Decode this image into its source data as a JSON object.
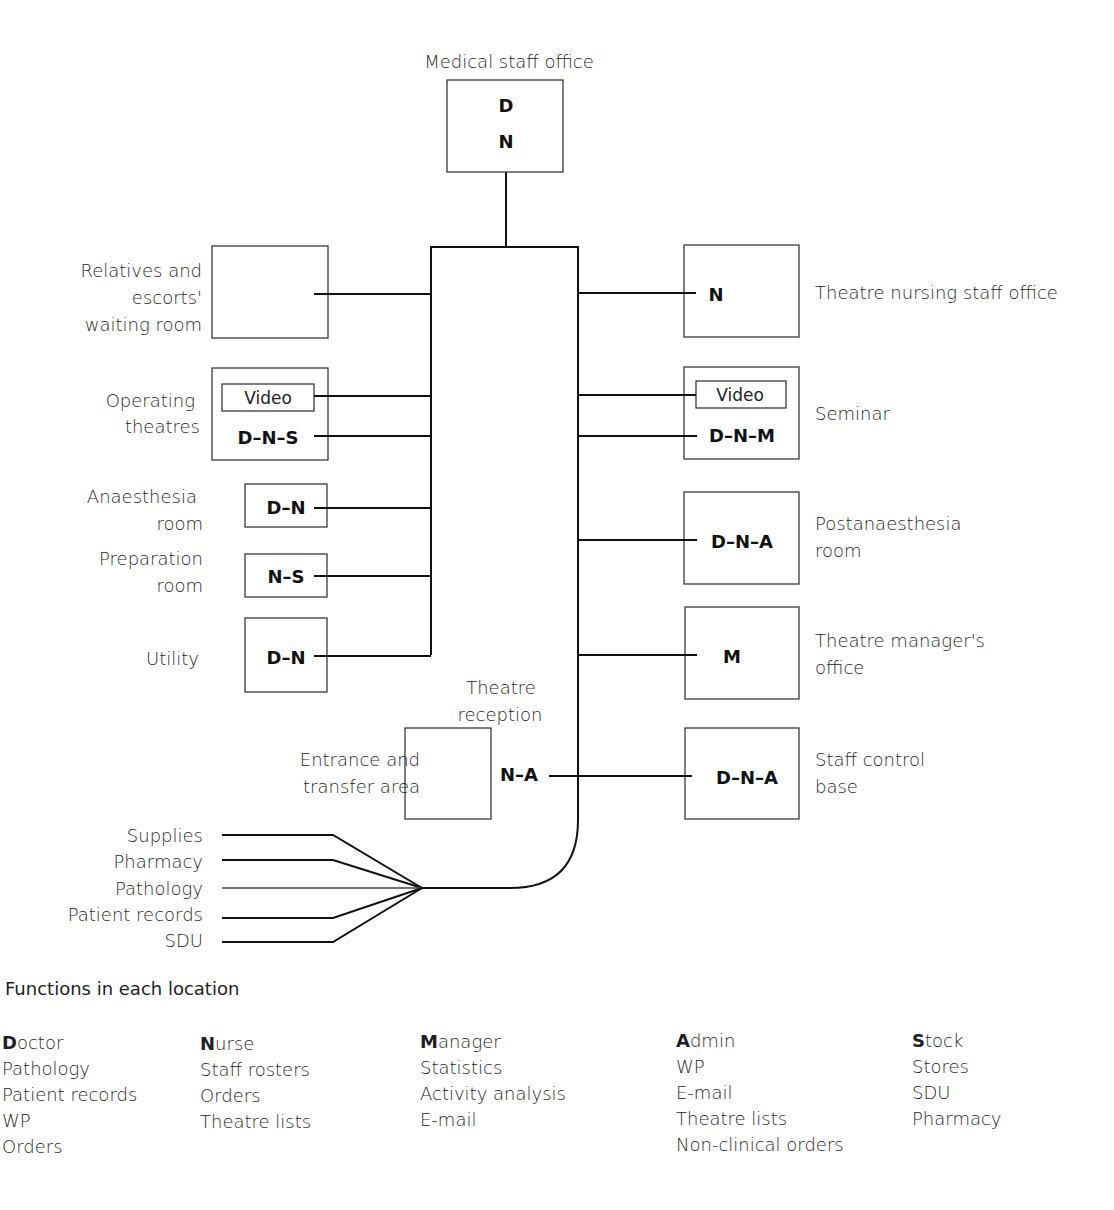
{
  "diagram": {
    "rooms": {
      "medical_staff_office": {
        "label": "Medical staff office",
        "codes": [
          "D",
          "N"
        ]
      },
      "relatives_waiting": {
        "label_lines": [
          "Relatives and",
          "escorts'",
          "waiting room"
        ]
      },
      "operating_theatres": {
        "label_lines": [
          "Operating",
          "theatres"
        ],
        "video": "Video",
        "code": "D–N–S"
      },
      "anaesthesia_room": {
        "label_lines": [
          "Anaesthesia",
          "room"
        ],
        "code": "D–N"
      },
      "preparation_room": {
        "label_lines": [
          "Preparation",
          "room"
        ],
        "code": "N–S"
      },
      "utility": {
        "label": "Utility",
        "code": "D–N"
      },
      "theatre_reception": {
        "label_lines": [
          "Theatre",
          "reception"
        ],
        "code": "N–A"
      },
      "entrance_transfer": {
        "label_lines": [
          "Entrance and",
          "transfer area"
        ]
      },
      "theatre_nursing_office": {
        "label": "Theatre nursing staff office",
        "code": "N"
      },
      "seminar": {
        "label": "Seminar",
        "video": "Video",
        "code": "D–N–M"
      },
      "postanaesthesia_room": {
        "label_lines": [
          "Postanaesthesia",
          "room"
        ],
        "code": "D–N–A"
      },
      "theatre_manager_office": {
        "label_lines": [
          "Theatre manager's",
          "office"
        ],
        "code": "M"
      },
      "staff_control_base": {
        "label_lines": [
          "Staff control",
          "base"
        ],
        "code": "D–N–A"
      }
    },
    "external_links": [
      "Supplies",
      "Pharmacy",
      "Pathology",
      "Patient records",
      "SDU"
    ]
  },
  "legend": {
    "title": "Functions in each location",
    "columns": [
      {
        "key": "D",
        "rest": "octor",
        "items": [
          "Pathology",
          "Patient records",
          "WP",
          "Orders"
        ]
      },
      {
        "key": "N",
        "rest": "urse",
        "items": [
          "Staff rosters",
          "Orders",
          "Theatre lists"
        ]
      },
      {
        "key": "M",
        "rest": "anager",
        "items": [
          "Statistics",
          "Activity analysis",
          "E-mail"
        ]
      },
      {
        "key": "A",
        "rest": "dmin",
        "items": [
          "WP",
          "E-mail",
          "Theatre lists",
          "Non-clinical orders"
        ]
      },
      {
        "key": "S",
        "rest": "tock",
        "items": [
          "Stores",
          "SDU",
          "Pharmacy"
        ]
      }
    ]
  }
}
